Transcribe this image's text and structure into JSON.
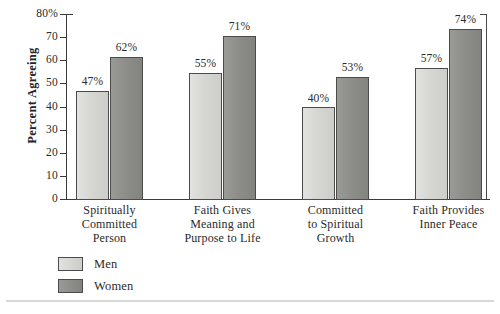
{
  "chart_data": {
    "type": "bar",
    "title": "",
    "xlabel": "",
    "ylabel": "Percent Agreeing",
    "ylim": [
      0,
      80
    ],
    "grid": false,
    "legend_position": "bottom-left",
    "y_ticks": [
      "80%",
      "70",
      "60",
      "50",
      "40",
      "30",
      "20",
      "10",
      "0"
    ],
    "y_tick_values": [
      80,
      70,
      60,
      50,
      40,
      30,
      20,
      10,
      0
    ],
    "categories": [
      "Spiritually Committed Person",
      "Faith Gives Meaning and Purpose to Life",
      "Committed to Spiritual Growth",
      "Faith Provides Inner Peace"
    ],
    "category_lines": [
      [
        "Spiritually",
        "Committed",
        "Person"
      ],
      [
        "Faith Gives",
        "Meaning and",
        "Purpose to Life"
      ],
      [
        "Committed",
        "to Spiritual",
        "Growth"
      ],
      [
        "Faith Provides",
        "Inner Peace"
      ]
    ],
    "series": [
      {
        "name": "Men",
        "color": "#d6d6d3",
        "values": [
          47,
          55,
          40,
          57
        ],
        "labels": [
          "47%",
          "55%",
          "40%",
          "57%"
        ]
      },
      {
        "name": "Women",
        "color": "#8d8d8a",
        "values": [
          62,
          71,
          53,
          74
        ],
        "labels": [
          "62%",
          "71%",
          "53%",
          "74%"
        ]
      }
    ]
  },
  "legend": {
    "items": [
      {
        "label": "Men",
        "color": "#d6d6d3"
      },
      {
        "label": "Women",
        "color": "#8d8d8a"
      }
    ]
  },
  "axis": {
    "y_title": "Percent Agreeing"
  }
}
